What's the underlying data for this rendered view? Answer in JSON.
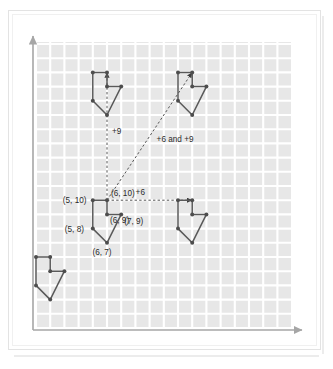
{
  "figure": {
    "type": "geometry-diagram"
  },
  "colors": {
    "shape_stroke": "#595959",
    "vertex_fill": "#4d4d4d",
    "grid_cell": "#e6e6e6",
    "grid_line": "#ffffff",
    "axis": "#a6a6a6",
    "dashed": "#555555",
    "label_text": "#2b2b2b",
    "frame": "#e3e3e3",
    "background": "#ffffff"
  },
  "axes": {
    "x_axis_name": "x-axis",
    "y_axis_name": "y-axis",
    "x_arrow": "right-arrow",
    "y_arrow": "up-arrow",
    "grid_visible": true,
    "grid_columns": 18,
    "grid_rows": 20,
    "tick_labels": []
  },
  "chart_data": {
    "type": "scatter",
    "xlabel": "",
    "ylabel": "",
    "grid": true,
    "shape_name": "arrow-polygon",
    "original_vertices": [
      {
        "label": "(5, 10)",
        "x": 5,
        "y": 10
      },
      {
        "label": "(6, 10)",
        "x": 6,
        "y": 10
      },
      {
        "label": "(6, 9)",
        "x": 6,
        "y": 9
      },
      {
        "label": "(7, 9)",
        "x": 7,
        "y": 9
      },
      {
        "label": "(6, 7)",
        "x": 6,
        "y": 7
      },
      {
        "label": "(5, 8)",
        "x": 5,
        "y": 8
      }
    ],
    "translations": [
      {
        "name": "vertical",
        "label": "+9",
        "dx": 0,
        "dy": 9
      },
      {
        "name": "horizontal",
        "label": "+6",
        "dx": 6,
        "dy": 0
      },
      {
        "name": "diagonal",
        "label": "+6 and +9",
        "dx": 6,
        "dy": 9
      }
    ],
    "images": [
      {
        "name": "original-shape",
        "dx": 0,
        "dy": 0,
        "labeled": true
      },
      {
        "name": "translated-up-shape",
        "dx": 0,
        "dy": 9,
        "labeled": false
      },
      {
        "name": "translated-right-shape",
        "dx": 6,
        "dy": 0,
        "labeled": false
      },
      {
        "name": "translated-diagonal-shape",
        "dx": 6,
        "dy": 9,
        "labeled": false
      },
      {
        "name": "extra-shape-lower-left",
        "dx": -4,
        "dy": -4,
        "labeled": false
      }
    ]
  },
  "labels": {
    "vertex_5_10": "(5, 10)",
    "vertex_6_10": "(6, 10)",
    "vertex_6_9": "(6, 9)",
    "vertex_7_9": "(7, 9)",
    "vertex_6_7": "(6, 7)",
    "vertex_5_8": "(5, 8)",
    "translate_up": "+9",
    "translate_right": "+6",
    "translate_diagonal": "+6 and +9"
  }
}
